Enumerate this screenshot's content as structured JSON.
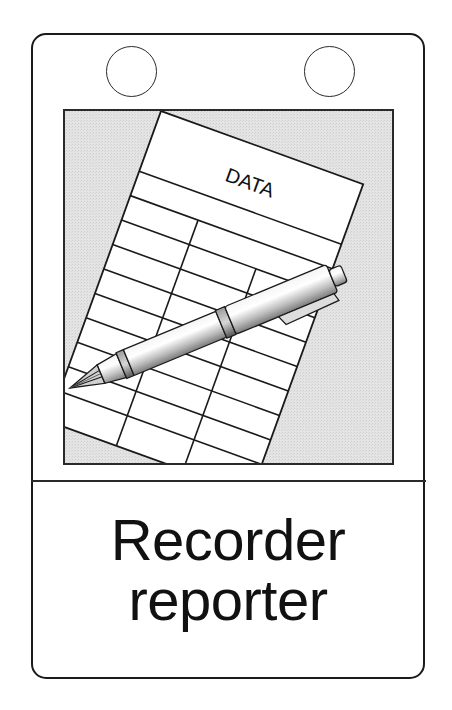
{
  "card": {
    "border_color": "#1a1a1a",
    "background": "#ffffff",
    "rings": [
      {
        "name": "binder-ring-left"
      },
      {
        "name": "binder-ring-right"
      }
    ]
  },
  "illustration": {
    "background_color": "#e6e6e6",
    "sheet_heading": "DATA",
    "sheet_rows": 9,
    "sheet_columns": 3,
    "pen_icon": "ballpoint-pen-icon",
    "sheet_icon": "data-sheet-icon"
  },
  "caption": {
    "line1": "Recorder",
    "line2": "reporter"
  }
}
